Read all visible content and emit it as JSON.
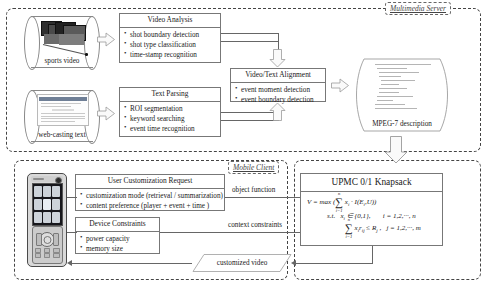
{
  "diagram": {
    "regions": {
      "server": {
        "label": "Multimedia Server"
      },
      "mobile": {
        "label": "Mobile Client"
      }
    },
    "sources": {
      "video": {
        "label": "sports video"
      },
      "text": {
        "label": "web-casting text"
      }
    },
    "boxes": {
      "video_analysis": {
        "header": "Video Analysis",
        "items": [
          "shot boundary detection",
          "shot type classification",
          "time-stamp recognition"
        ]
      },
      "text_parsing": {
        "header": "Text Parsing",
        "items": [
          "ROI segmentation",
          "keyword searching",
          "event time recognition"
        ]
      },
      "alignment": {
        "header": "Video/Text Alignment",
        "items": [
          "event moment detection",
          "event boundary detection"
        ]
      },
      "user_request": {
        "header": "User Customization Request",
        "items": [
          "customization mode (retrieval / summarization)",
          "content preference (player + event + time )"
        ]
      },
      "device_constraints": {
        "header": "Device Constraints",
        "items": [
          "power capacity",
          "memory size"
        ]
      },
      "knapsack": {
        "header": "UPMC 0/1 Knapsack",
        "formula_lines": [
          "V = max ( ∑ xᵢ · I(Eᵢ,U) )",
          "s.t.   xᵢ ∈ {0,1},      i = 1,2,···, n",
          "∑ xᵢ rᵢⱼ ≤ Rⱼ ,   j = 1,2,···, m"
        ]
      }
    },
    "artifacts": {
      "mpeg7": {
        "label": "MPEG-7 description"
      },
      "customized_video": {
        "label": "customized video"
      }
    },
    "edges": {
      "object_function": "object function",
      "context_constraints": "context constraints"
    },
    "colors": {
      "line": "#777777",
      "dash": "#444444",
      "text": "#1a1a1a",
      "arrow_fill": "#fafafa",
      "arrow_stroke": "#999999"
    }
  }
}
